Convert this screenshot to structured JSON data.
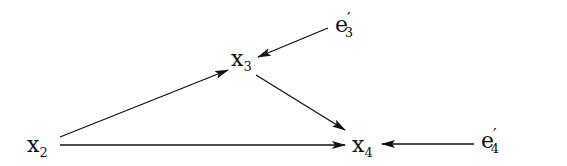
{
  "diagram": {
    "type": "path-diagram",
    "nodes": [
      {
        "id": "x2",
        "base": "x",
        "sub": "2",
        "prime": ""
      },
      {
        "id": "x3",
        "base": "x",
        "sub": "3",
        "prime": ""
      },
      {
        "id": "x4",
        "base": "x",
        "sub": "4",
        "prime": ""
      },
      {
        "id": "e3p",
        "base": "e",
        "sub": "3",
        "prime": "′"
      },
      {
        "id": "e4p",
        "base": "e",
        "sub": "4",
        "prime": "′"
      }
    ],
    "edges": [
      {
        "from": "x2",
        "to": "x3"
      },
      {
        "from": "x2",
        "to": "x4"
      },
      {
        "from": "x3",
        "to": "x4"
      },
      {
        "from": "e3p",
        "to": "x3"
      },
      {
        "from": "e4p",
        "to": "x4"
      }
    ],
    "colors": {
      "ink": "#111111",
      "background": "#ffffff"
    }
  }
}
